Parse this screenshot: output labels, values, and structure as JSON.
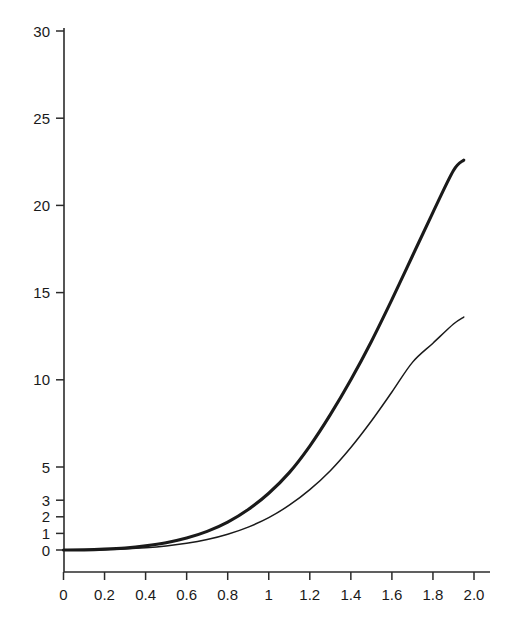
{
  "chart_data": {
    "type": "line",
    "title": "",
    "subtitle": "",
    "xlabel": "",
    "ylabel": "",
    "xlim": [
      0,
      2.0
    ],
    "ylim": [
      0,
      30
    ],
    "grid": false,
    "legend": null,
    "legend_position": "none",
    "annotations": [],
    "axis_note": "y-axis uses a broken/compressed scale below 5 with extra ticks at 1, 2 and 3",
    "xticks": [
      0,
      0.2,
      0.4,
      0.6,
      0.8,
      1,
      1.2,
      1.4,
      1.6,
      1.8,
      2.0
    ],
    "xticklabels": [
      "0",
      "0.2",
      "0.4",
      "0.6",
      "0.8",
      "1",
      "1.2",
      "1.4",
      "1.6",
      "1.8",
      "2.0"
    ],
    "yticks": [
      0,
      1,
      2,
      3,
      5,
      10,
      15,
      20,
      25,
      30
    ],
    "yticklabels": [
      "0",
      "1",
      "2",
      "3",
      "5",
      "10",
      "15",
      "20",
      "25",
      "30"
    ],
    "x": [
      0,
      0.1,
      0.2,
      0.3,
      0.4,
      0.5,
      0.6,
      0.7,
      0.8,
      0.9,
      1.0,
      1.1,
      1.2,
      1.3,
      1.4,
      1.5,
      1.6,
      1.7,
      1.8,
      1.9,
      1.95
    ],
    "series": [
      {
        "name": "upper-curve",
        "style": "thick",
        "values": [
          0.0,
          0.01,
          0.05,
          0.12,
          0.25,
          0.44,
          0.72,
          1.12,
          1.68,
          2.44,
          3.42,
          4.66,
          6.2,
          8.0,
          10.0,
          12.2,
          14.6,
          17.1,
          19.6,
          22.0,
          22.6
        ]
      },
      {
        "name": "lower-curve",
        "style": "thin",
        "values": [
          0.0,
          0.005,
          0.02,
          0.06,
          0.13,
          0.24,
          0.4,
          0.63,
          0.95,
          1.38,
          1.95,
          2.7,
          3.64,
          4.78,
          6.12,
          7.64,
          9.3,
          11.0,
          12.1,
          13.2,
          13.6
        ]
      }
    ]
  },
  "figure": {
    "background_color": "#ffffff",
    "axis_color": "#2b2b2b",
    "curve_color": "#1a1a1a"
  }
}
